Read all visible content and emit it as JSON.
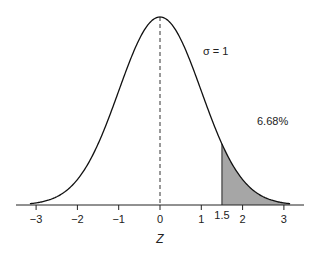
{
  "chart_data": {
    "type": "area",
    "title": "",
    "xlabel": "Z",
    "ylabel": "",
    "xlim": [
      -3.3,
      3.3
    ],
    "x_ticks": [
      -3,
      -2,
      -1,
      0,
      1,
      2,
      3
    ],
    "x_tick_labels": [
      "−3",
      "−2",
      "−1",
      "0",
      "1",
      "2",
      "3"
    ],
    "extra_tick": {
      "value": 1.5,
      "label": "1.5"
    },
    "distribution": {
      "name": "normal",
      "mean": 0,
      "sd": 1
    },
    "mean_line": {
      "x": 0,
      "style": "dashed"
    },
    "shaded_region": {
      "from": 1.5,
      "to": 3.3,
      "area_percent": 6.68,
      "color": "#a6a6a6"
    },
    "annotations": [
      {
        "text": "σ = 1",
        "x": 1.0,
        "y_frac": 0.77
      },
      {
        "text": "6.68%",
        "x": 2.5,
        "y_frac": 0.44
      }
    ],
    "grid": false,
    "legend": null
  }
}
